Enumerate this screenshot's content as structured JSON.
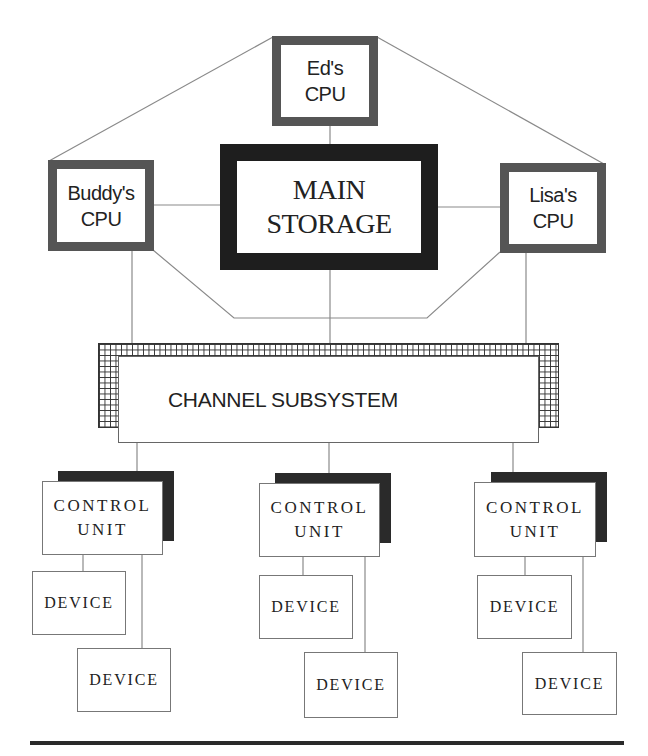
{
  "diagram": {
    "cpus": [
      {
        "id": "ed",
        "line1": "Ed's",
        "line2": "CPU"
      },
      {
        "id": "buddy",
        "line1": "Buddy's",
        "line2": "CPU"
      },
      {
        "id": "lisa",
        "line1": "Lisa's",
        "line2": "CPU"
      }
    ],
    "main_storage": {
      "line1": "MAIN",
      "line2": "STORAGE"
    },
    "channel_subsystem": {
      "label": "CHANNEL SUBSYSTEM"
    },
    "control_units": [
      {
        "line1": "CONTROL",
        "line2": "UNIT",
        "devices": [
          "DEVICE",
          "DEVICE"
        ]
      },
      {
        "line1": "CONTROL",
        "line2": "UNIT",
        "devices": [
          "DEVICE",
          "DEVICE"
        ]
      },
      {
        "line1": "CONTROL",
        "line2": "UNIT",
        "devices": [
          "DEVICE",
          "DEVICE"
        ]
      }
    ]
  },
  "colors": {
    "cpu_border": "#555555",
    "storage_border": "#1e1e1e",
    "shadow": "#2a2a2a",
    "line": "#888888"
  }
}
